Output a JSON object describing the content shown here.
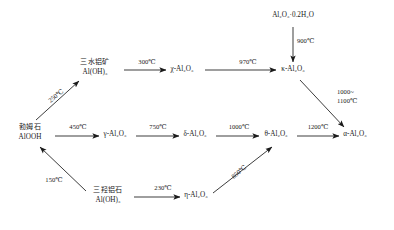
{
  "diagram": {
    "type": "flow-diagram",
    "stroke_color": "#1a1a1a",
    "text_color": "#1a1a1a",
    "background_color": "#ffffff",
    "nodes": [
      {
        "id": "gibbsite",
        "line1": "三水铝矿",
        "line2": "Al(OH)₃",
        "x": 95,
        "y": 68
      },
      {
        "id": "chi",
        "line1": "χ-Al₂O₃",
        "line2": "",
        "x": 182,
        "y": 72
      },
      {
        "id": "hydrate",
        "line1": "Al₂O₃·0.2H₂O",
        "line2": "",
        "x": 293,
        "y": 18
      },
      {
        "id": "kappa",
        "line1": "κ-Al₂O₃",
        "line2": "",
        "x": 293,
        "y": 72
      },
      {
        "id": "boehmite",
        "line1": "勃姆石",
        "line2": "AlOOH",
        "x": 30,
        "y": 133
      },
      {
        "id": "gamma",
        "line1": "γ-Al₂O₃",
        "line2": "",
        "x": 115,
        "y": 137
      },
      {
        "id": "delta",
        "line1": "δ-Al₂O₃",
        "line2": "",
        "x": 195,
        "y": 137
      },
      {
        "id": "theta",
        "line1": "θ-Al₂O₃",
        "line2": "",
        "x": 276,
        "y": 137
      },
      {
        "id": "alpha",
        "line1": "α-Al₂O₃",
        "line2": "",
        "x": 355,
        "y": 137
      },
      {
        "id": "bayerite",
        "line1": "三羟铝石",
        "line2": "Al(OH)₃",
        "x": 108,
        "y": 196
      },
      {
        "id": "eta",
        "line1": "η-Al₂O₃",
        "line2": "",
        "x": 196,
        "y": 198
      }
    ],
    "edges": [
      {
        "id": "boehmite-to-gibbsite",
        "from": "boehmite",
        "to": "gibbsite",
        "label": "250℃",
        "label_x": 56,
        "label_y": 96,
        "rotation": -38,
        "style": "diagonal"
      },
      {
        "id": "gibbsite-to-chi",
        "from": "gibbsite",
        "to": "chi",
        "label": "300℃",
        "label_x": 147,
        "label_y": 62,
        "rotation": 0,
        "style": "horizontal"
      },
      {
        "id": "chi-to-kappa",
        "from": "chi",
        "to": "kappa",
        "label": "970℃",
        "label_x": 248,
        "label_y": 62,
        "rotation": 0,
        "style": "horizontal"
      },
      {
        "id": "hydrate-to-kappa",
        "from": "hydrate",
        "to": "kappa",
        "label": "900℃",
        "label_x": 312,
        "label_y": 42,
        "rotation": 0,
        "style": "vertical"
      },
      {
        "id": "kappa-to-alpha",
        "from": "kappa",
        "to": "alpha",
        "label": "1000~\n1100℃",
        "label_x": 353,
        "label_y": 99,
        "rotation": 0,
        "style": "diagonal"
      },
      {
        "id": "boehmite-to-gamma",
        "from": "boehmite",
        "to": "gamma",
        "label": "450℃",
        "label_x": 78,
        "label_y": 127,
        "rotation": 0,
        "style": "horizontal"
      },
      {
        "id": "gamma-to-delta",
        "from": "gamma",
        "to": "delta",
        "label": "750℃",
        "label_x": 158,
        "label_y": 127,
        "rotation": 0,
        "style": "horizontal"
      },
      {
        "id": "delta-to-theta",
        "from": "delta",
        "to": "theta",
        "label": "1000℃",
        "label_x": 238,
        "label_y": 127,
        "rotation": 0,
        "style": "horizontal"
      },
      {
        "id": "theta-to-alpha",
        "from": "theta",
        "to": "alpha",
        "label": "1200℃",
        "label_x": 317,
        "label_y": 127,
        "rotation": 0,
        "style": "horizontal"
      },
      {
        "id": "bayerite-to-boehmite",
        "from": "bayerite",
        "to": "boehmite",
        "label": "150℃",
        "label_x": 54,
        "label_y": 180,
        "rotation": 0,
        "style": "diagonal"
      },
      {
        "id": "bayerite-to-eta",
        "from": "bayerite",
        "to": "eta",
        "label": "230℃",
        "label_x": 163,
        "label_y": 188,
        "rotation": 0,
        "style": "horizontal"
      },
      {
        "id": "eta-to-theta",
        "from": "eta",
        "to": "theta",
        "label": "850℃",
        "label_x": 238,
        "label_y": 172,
        "rotation": -40,
        "style": "diagonal"
      }
    ]
  }
}
